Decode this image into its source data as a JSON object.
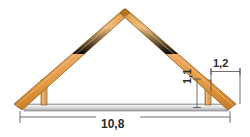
{
  "figure": {
    "name": "roof-truss-elevation",
    "background_color": "#ffffff"
  },
  "colors": {
    "wood_fill": "#e8a045",
    "wood_fill_light": "#f3c98b",
    "wood_edge": "#8a5a22",
    "beam_fill": "#d8d8d8",
    "beam_edge": "#8c8c8c",
    "dimension_line": "#4a4a4a",
    "text": "#2b2b2b"
  },
  "dimensions": {
    "span": {
      "label": "10,8",
      "orientation": "horizontal",
      "position": "bottom"
    },
    "overhang": {
      "label": "1,2",
      "orientation": "horizontal",
      "position": "upper-right"
    },
    "wall_height": {
      "label": "1,1",
      "orientation": "vertical",
      "position": "right"
    }
  },
  "members": [
    {
      "name": "left-rafter",
      "type": "rafter"
    },
    {
      "name": "right-rafter",
      "type": "rafter"
    },
    {
      "name": "tie-beam",
      "type": "beam"
    },
    {
      "name": "left-post",
      "type": "post"
    },
    {
      "name": "right-post",
      "type": "post"
    }
  ]
}
